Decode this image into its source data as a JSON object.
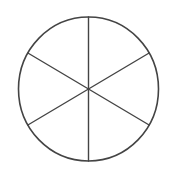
{
  "diagram": {
    "type": "circle-divided-into-sectors",
    "sector_count": 6,
    "stroke_color": "#444444",
    "background_color": "#ffffff",
    "circle": {
      "cx": 88.5,
      "cy": 89,
      "rx": 70,
      "ry": 72
    },
    "stroke_width": 1.6
  }
}
